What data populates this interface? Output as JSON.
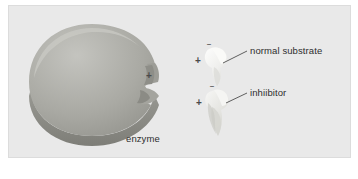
{
  "figure": {
    "panel_background": "#e9e9e9",
    "panel_border": "#dcdcdc",
    "page_background": "#ffffff"
  },
  "enzyme": {
    "label": "enzyme",
    "body_color": "#a9a9a4",
    "top_highlight": "#b8b8b2",
    "side_shadow": "#8a8a84",
    "notch_shadow": "#8f8f89",
    "active_site_charge": "+"
  },
  "substrates": [
    {
      "id": "normal-substrate",
      "label": "normal substrate",
      "charge_top": "–",
      "charge_left": "+",
      "fill_color": "#f2f2f0",
      "shade_color": "#dcdcd8"
    },
    {
      "id": "inhibitor",
      "label": "inhiibitor",
      "charge_top": "–",
      "charge_left": "+",
      "fill_color": "#e4e4e0",
      "shade_color": "#cfcfca"
    }
  ],
  "colors": {
    "label_text": "#2e2e2e",
    "charge_text": "#4a4a4a",
    "leader_line": "#3a3a3a"
  }
}
